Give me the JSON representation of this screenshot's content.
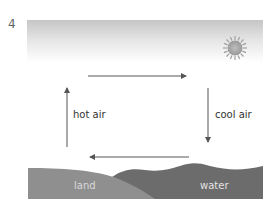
{
  "figure": {
    "number": "4",
    "labels": {
      "hot_air": "hot air",
      "cool_air": "cool air",
      "land": "land",
      "water": "water"
    },
    "icons": {
      "sun": "sun-icon",
      "arrows": [
        "arrow-right",
        "arrow-down",
        "arrow-left",
        "arrow-up"
      ]
    },
    "colors": {
      "sky_top": "#c8c8c8",
      "sky_bottom": "#ffffff",
      "sun": "#a9a9a9",
      "land": "#8e8e8e",
      "water": "#6e6e6e",
      "arrow": "#555555"
    }
  }
}
